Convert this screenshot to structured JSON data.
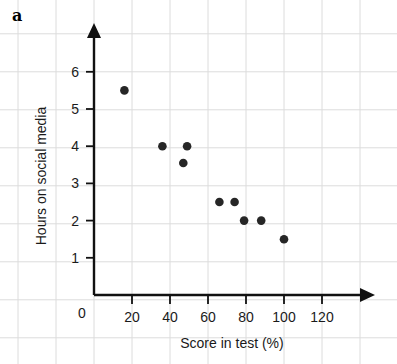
{
  "figure": {
    "part_label": "a"
  },
  "chart_data": {
    "type": "scatter",
    "title": "",
    "xlabel": "Score in test (%)",
    "ylabel": "Hours on social media",
    "xlim": [
      0,
      130
    ],
    "ylim": [
      0,
      6.7
    ],
    "xticks": [
      0,
      20,
      40,
      60,
      80,
      100,
      120
    ],
    "xtick_labels": [
      "0",
      "20",
      "40",
      "60",
      "80",
      "100",
      "120"
    ],
    "yticks": [
      1,
      2,
      3,
      4,
      5,
      6
    ],
    "ytick_labels": [
      "1",
      "2",
      "3",
      "4",
      "5",
      "6"
    ],
    "grid": true,
    "grid_color": "#dcdcdc",
    "legend": null,
    "point_color": "#262626",
    "points": [
      {
        "x": 16,
        "y": 5.5
      },
      {
        "x": 36,
        "y": 4.0
      },
      {
        "x": 49,
        "y": 4.0
      },
      {
        "x": 47,
        "y": 3.55
      },
      {
        "x": 66,
        "y": 2.5
      },
      {
        "x": 74,
        "y": 2.5
      },
      {
        "x": 79,
        "y": 2.0
      },
      {
        "x": 88,
        "y": 2.0
      },
      {
        "x": 100,
        "y": 1.5
      }
    ]
  },
  "axes": {
    "origin_label": "0"
  }
}
